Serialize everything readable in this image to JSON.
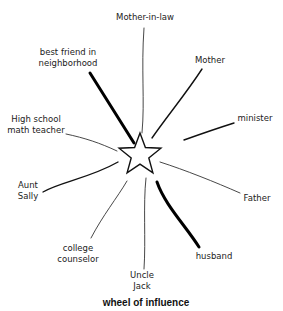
{
  "diagram": {
    "title": "wheel of influence",
    "center": {
      "shape": "star",
      "x": 140,
      "y": 155,
      "r": 22
    },
    "nodes": [
      {
        "id": "mother-in-law",
        "lines": [
          "Mother-in-law"
        ],
        "x": 145,
        "y": 20,
        "anchor": "middle",
        "weight": "thin",
        "path": "M144,28 C141,70 145,100 142,133"
      },
      {
        "id": "best-friend",
        "lines": [
          "best friend in",
          "neighborhood"
        ],
        "x": 68,
        "y": 55,
        "anchor": "middle",
        "weight": "thick",
        "path": "M90,73 L134,143"
      },
      {
        "id": "mother",
        "lines": [
          "Mother"
        ],
        "x": 210,
        "y": 63,
        "anchor": "middle",
        "weight": "med",
        "path": "M202,69 C185,95 168,115 152,138"
      },
      {
        "id": "minister",
        "lines": [
          "minister"
        ],
        "x": 255,
        "y": 121,
        "anchor": "middle",
        "weight": "med",
        "path": "M234,123 C215,129 198,135 184,140"
      },
      {
        "id": "math-teacher",
        "lines": [
          "High school",
          "math teacher"
        ],
        "x": 36,
        "y": 122,
        "anchor": "middle",
        "weight": "thin",
        "path": "M66,134 C85,138 100,143 117,151"
      },
      {
        "id": "aunt-sally",
        "lines": [
          "Aunt",
          "Sally"
        ],
        "x": 28,
        "y": 188,
        "anchor": "middle",
        "weight": "med",
        "path": "M43,192 C60,182 90,178 118,162"
      },
      {
        "id": "father",
        "lines": [
          "Father"
        ],
        "x": 257,
        "y": 201,
        "anchor": "middle",
        "weight": "thin",
        "path": "M240,193 C215,182 185,170 160,162"
      },
      {
        "id": "college-counselor",
        "lines": [
          "college",
          "counselor"
        ],
        "x": 78,
        "y": 251,
        "anchor": "middle",
        "weight": "thin",
        "path": "M91,238 C103,215 117,198 127,181"
      },
      {
        "id": "uncle-jack",
        "lines": [
          "Uncle",
          "Jack"
        ],
        "x": 142,
        "y": 278,
        "anchor": "middle",
        "weight": "thin",
        "path": "M144,269 C146,240 143,205 146,178"
      },
      {
        "id": "husband",
        "lines": [
          "husband"
        ],
        "x": 214,
        "y": 259,
        "anchor": "middle",
        "weight": "thick",
        "path": "M157,182 C165,205 185,225 199,247"
      }
    ]
  }
}
